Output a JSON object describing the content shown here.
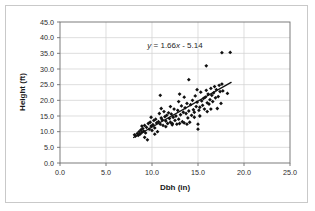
{
  "figure": {
    "background_color": "#ffffff",
    "border_color": "#c9c9c9",
    "point_color": "#111111",
    "grid_color": "#d0d0d0",
    "axis_color": "#6e6e6e"
  },
  "chart_data": {
    "type": "scatter",
    "title": "",
    "xlabel": "Dbh (in)",
    "ylabel": "Height (ft)",
    "xlim": [
      0.0,
      25.0
    ],
    "ylim": [
      0.0,
      45.0
    ],
    "xticks": [
      "0.0",
      "5.0",
      "10.0",
      "15.0",
      "20.0",
      "25.0"
    ],
    "ytick_values": [
      0.0,
      5.0,
      10.0,
      15.0,
      20.0,
      25.0,
      30.0,
      35.0,
      40.0,
      45.0
    ],
    "xtick_values": [
      0.0,
      5.0,
      10.0,
      15.0,
      20.0,
      25.0
    ],
    "yticks": [
      "0.0",
      "5.0",
      "10.0",
      "15.0",
      "20.0",
      "25.0",
      "30.0",
      "35.0",
      "40.0",
      "45.0"
    ],
    "grid": true,
    "grid_axis": "both",
    "legend": false,
    "annotation": "y = 1.66x - 5.14",
    "annotation_parts": {
      "y": "y",
      "eq": " = 1.66",
      "x": "x",
      "tail": " - 5.14"
    },
    "trendline": {
      "slope": 1.66,
      "intercept": -5.14,
      "x_start": 8.0,
      "x_end": 18.6
    },
    "marker": "diamond",
    "points": [
      [
        8.1,
        9.0
      ],
      [
        8.2,
        8.6
      ],
      [
        8.4,
        9.4
      ],
      [
        8.5,
        8.8
      ],
      [
        8.6,
        10.0
      ],
      [
        8.7,
        9.2
      ],
      [
        8.8,
        10.6
      ],
      [
        8.9,
        9.8
      ],
      [
        9.0,
        11.0
      ],
      [
        9.1,
        10.2
      ],
      [
        9.2,
        12.0
      ],
      [
        9.3,
        9.6
      ],
      [
        9.4,
        11.4
      ],
      [
        9.5,
        7.4
      ],
      [
        9.6,
        12.6
      ],
      [
        9.7,
        10.8
      ],
      [
        9.8,
        13.0
      ],
      [
        9.9,
        11.8
      ],
      [
        10.0,
        10.4
      ],
      [
        10.1,
        12.2
      ],
      [
        10.2,
        13.6
      ],
      [
        10.3,
        11.2
      ],
      [
        10.4,
        14.0
      ],
      [
        10.5,
        12.8
      ],
      [
        10.6,
        10.0
      ],
      [
        10.7,
        13.2
      ],
      [
        10.8,
        15.8
      ],
      [
        10.9,
        12.4
      ],
      [
        11.0,
        14.4
      ],
      [
        11.1,
        13.8
      ],
      [
        11.2,
        12.0
      ],
      [
        11.3,
        16.4
      ],
      [
        11.4,
        14.8
      ],
      [
        11.5,
        13.4
      ],
      [
        11.6,
        15.2
      ],
      [
        11.7,
        12.6
      ],
      [
        11.8,
        16.0
      ],
      [
        11.9,
        14.2
      ],
      [
        12.0,
        13.0
      ],
      [
        12.1,
        15.6
      ],
      [
        12.2,
        12.2
      ],
      [
        12.3,
        14.6
      ],
      [
        12.4,
        17.2
      ],
      [
        12.5,
        13.6
      ],
      [
        12.6,
        15.0
      ],
      [
        12.7,
        12.4
      ],
      [
        12.8,
        16.8
      ],
      [
        12.9,
        14.0
      ],
      [
        13.0,
        12.6
      ],
      [
        13.1,
        15.4
      ],
      [
        13.2,
        18.2
      ],
      [
        13.3,
        13.2
      ],
      [
        13.4,
        16.2
      ],
      [
        13.5,
        12.8
      ],
      [
        13.6,
        17.6
      ],
      [
        13.7,
        15.8
      ],
      [
        13.8,
        19.0
      ],
      [
        13.9,
        14.4
      ],
      [
        14.0,
        16.6
      ],
      [
        14.1,
        13.0
      ],
      [
        14.2,
        18.6
      ],
      [
        14.3,
        15.2
      ],
      [
        14.4,
        20.0
      ],
      [
        14.5,
        17.0
      ],
      [
        14.6,
        16.2
      ],
      [
        14.7,
        21.4
      ],
      [
        14.8,
        18.0
      ],
      [
        14.9,
        19.4
      ],
      [
        15.0,
        10.8
      ],
      [
        15.1,
        16.8
      ],
      [
        15.2,
        17.8
      ],
      [
        15.3,
        22.6
      ],
      [
        15.4,
        19.8
      ],
      [
        15.5,
        18.4
      ],
      [
        15.6,
        20.6
      ],
      [
        15.7,
        17.2
      ],
      [
        15.8,
        21.0
      ],
      [
        15.9,
        23.2
      ],
      [
        16.0,
        19.2
      ],
      [
        16.1,
        22.0
      ],
      [
        16.2,
        18.8
      ],
      [
        16.3,
        20.2
      ],
      [
        16.4,
        23.8
      ],
      [
        16.5,
        21.6
      ],
      [
        16.6,
        19.6
      ],
      [
        16.7,
        22.4
      ],
      [
        16.8,
        24.4
      ],
      [
        16.9,
        20.8
      ],
      [
        17.0,
        23.4
      ],
      [
        17.1,
        17.4
      ],
      [
        17.2,
        21.2
      ],
      [
        17.3,
        24.8
      ],
      [
        17.4,
        22.8
      ],
      [
        17.5,
        19.0
      ],
      [
        17.6,
        25.2
      ],
      [
        17.7,
        23.0
      ],
      [
        10.9,
        21.6
      ],
      [
        14.0,
        26.6
      ],
      [
        15.9,
        31.0
      ],
      [
        17.6,
        35.2
      ],
      [
        18.5,
        35.3
      ],
      [
        18.2,
        22.2
      ],
      [
        12.0,
        18.0
      ],
      [
        11.0,
        17.4
      ],
      [
        9.9,
        14.6
      ],
      [
        13.5,
        21.0
      ],
      [
        16.0,
        16.4
      ],
      [
        15.2,
        15.0
      ],
      [
        14.6,
        14.6
      ],
      [
        12.9,
        19.6
      ],
      [
        13.0,
        22.0
      ],
      [
        14.9,
        23.4
      ],
      [
        16.4,
        17.2
      ],
      [
        15.0,
        12.4
      ],
      [
        12.2,
        12.6
      ],
      [
        9.2,
        8.2
      ],
      [
        8.9,
        11.8
      ],
      [
        10.3,
        9.2
      ],
      [
        11.5,
        11.6
      ],
      [
        13.8,
        12.4
      ]
    ]
  }
}
